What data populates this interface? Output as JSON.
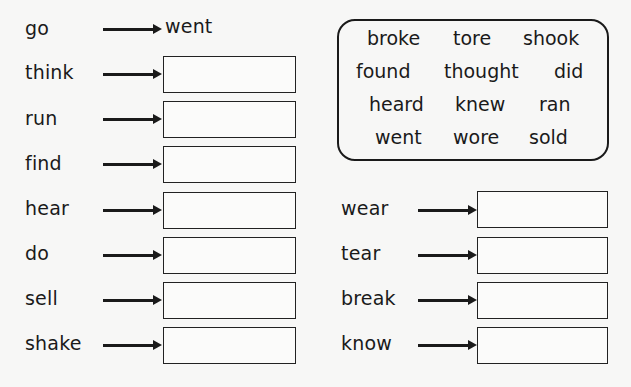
{
  "example": {
    "verb": "go",
    "past": "went"
  },
  "left_column": [
    {
      "verb": "think",
      "answer": ""
    },
    {
      "verb": "run",
      "answer": ""
    },
    {
      "verb": "find",
      "answer": ""
    },
    {
      "verb": "hear",
      "answer": ""
    },
    {
      "verb": "do",
      "answer": ""
    },
    {
      "verb": "sell",
      "answer": ""
    },
    {
      "verb": "shake",
      "answer": ""
    }
  ],
  "right_column": [
    {
      "verb": "wear",
      "answer": ""
    },
    {
      "verb": "tear",
      "answer": ""
    },
    {
      "verb": "break",
      "answer": ""
    },
    {
      "verb": "know",
      "answer": ""
    }
  ],
  "word_bank": [
    [
      "broke",
      "tore",
      "shook"
    ],
    [
      "found",
      "thought",
      "did"
    ],
    [
      "heard",
      "knew",
      "ran"
    ],
    [
      "went",
      "wore",
      "sold"
    ]
  ]
}
